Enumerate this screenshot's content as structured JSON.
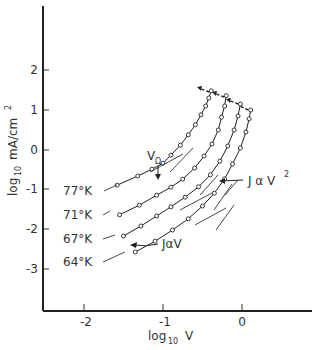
{
  "chart_data": {
    "type": "line",
    "title": "",
    "xlabel": "log10 V",
    "ylabel": "log10 mA/cm²",
    "xlim": [
      -2.5,
      0.9
    ],
    "ylim": [
      -4.0,
      3.4
    ],
    "x_ticks": [
      -2,
      -1,
      0
    ],
    "y_ticks": [
      2,
      1,
      0,
      -1,
      -2,
      -3
    ],
    "grid": false,
    "legend": "inline labels at left end of each curve",
    "series": [
      {
        "name": "77°K",
        "x": [
          -1.58,
          -1.32,
          -1.14,
          -1.0,
          -0.9,
          -0.78,
          -0.68,
          -0.59,
          -0.52,
          -0.46,
          -0.42,
          -0.39
        ],
        "y": [
          -0.88,
          -0.65,
          -0.48,
          -0.33,
          -0.13,
          0.12,
          0.38,
          0.63,
          0.88,
          1.1,
          1.3,
          1.48
        ]
      },
      {
        "name": "71°K",
        "x": [
          -1.55,
          -1.3,
          -1.08,
          -0.9,
          -0.75,
          -0.6,
          -0.48,
          -0.38,
          -0.3,
          -0.26,
          -0.22,
          -0.2
        ],
        "y": [
          -1.62,
          -1.38,
          -1.13,
          -0.93,
          -0.73,
          -0.45,
          -0.15,
          0.15,
          0.5,
          0.82,
          1.1,
          1.36
        ]
      },
      {
        "name": "67°K",
        "x": [
          -1.5,
          -1.28,
          -1.08,
          -0.9,
          -0.72,
          -0.55,
          -0.4,
          -0.28,
          -0.18,
          -0.1,
          -0.05,
          -0.02
        ],
        "y": [
          -2.15,
          -1.9,
          -1.65,
          -1.42,
          -1.18,
          -0.92,
          -0.62,
          -0.28,
          0.1,
          0.5,
          0.85,
          1.15
        ]
      },
      {
        "name": "64°K",
        "x": [
          -1.35,
          -1.1,
          -0.88,
          -0.68,
          -0.5,
          -0.35,
          -0.22,
          -0.12,
          -0.02,
          0.05,
          0.09,
          0.11
        ],
        "y": [
          -2.55,
          -2.28,
          -2.0,
          -1.72,
          -1.4,
          -1.08,
          -0.72,
          -0.35,
          0.05,
          0.45,
          0.78,
          1.0
        ]
      }
    ],
    "annotations": [
      {
        "text": "VΩ",
        "points_to": "77°K curve near log10 V ≈ -0.9"
      },
      {
        "text": "J α V²",
        "points_to": "steep tangent line on 64°K curve"
      },
      {
        "text": "J α V",
        "points_to": "linear tangent line on 64°K curve"
      }
    ]
  },
  "labels": {
    "y_axis_main": "log",
    "y_axis_sub": "10",
    "y_axis_unit": "mA/cm",
    "y_axis_unit_sup": "2",
    "x_axis_main": "log",
    "x_axis_sub": "10",
    "x_axis_var": "V",
    "annot_vohm_main": "V",
    "annot_vohm_sub": "Ω",
    "annot_jv2_main": "J α V",
    "annot_jv2_sup": "2",
    "annot_jv": "JαV",
    "curve_77": "77°K",
    "curve_71": "71°K",
    "curve_67": "67°K",
    "curve_64": "64°K",
    "tick_y_2": "2",
    "tick_y_1": "1",
    "tick_y_0": "0",
    "tick_y_m1": "-1",
    "tick_y_m2": "-2",
    "tick_y_m3": "-3",
    "tick_x_m2": "-2",
    "tick_x_m1": "-1",
    "tick_x_0": "0"
  }
}
